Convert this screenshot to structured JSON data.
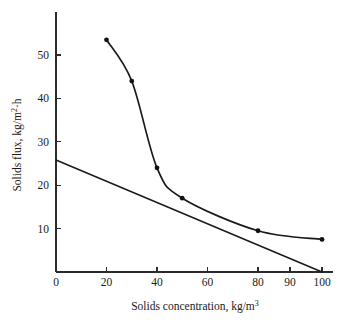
{
  "chart_data": {
    "type": "line",
    "title": "",
    "xlabel": "Solids concentration, kg/m",
    "xlabel_sup": "3",
    "ylabel": "Solids flux, kg/m",
    "ylabel_sup": "2",
    "ylabel_tail": "·h",
    "xlim": [
      0,
      100
    ],
    "ylim": [
      0,
      56
    ],
    "grid": false,
    "legend": "none",
    "xticks": [
      0,
      20,
      40,
      60,
      80,
      90,
      100
    ],
    "xtick_labels": [
      "0",
      "20",
      "40",
      "60",
      "80",
      "90",
      "100"
    ],
    "yticks": [
      10,
      20,
      30,
      40,
      50
    ],
    "ytick_labels": [
      "10",
      "20",
      "30",
      "40",
      "50"
    ],
    "series": [
      {
        "name": "Solids flux curve",
        "type": "line-with-markers",
        "marker": "filled-circle",
        "x": [
          20,
          30,
          40,
          50,
          80,
          100
        ],
        "values": [
          53.5,
          44.0,
          24.0,
          17.0,
          9.5,
          7.5
        ]
      },
      {
        "name": "Operating line",
        "type": "line",
        "marker": "none",
        "x": [
          0,
          100
        ],
        "values": [
          25.8,
          0.0
        ]
      }
    ],
    "annotations": []
  },
  "figure": {
    "background_color": "#ffffff",
    "ink_color": "#1a1a1a"
  }
}
